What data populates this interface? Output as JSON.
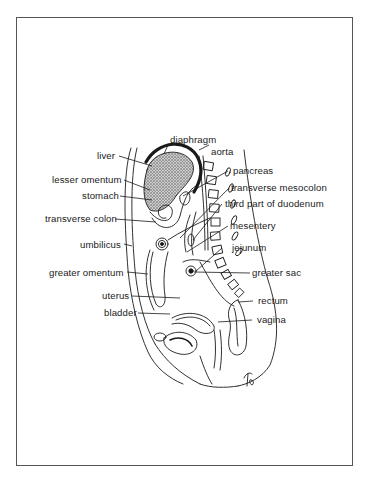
{
  "figure": {
    "type": "anatomical-sagittal-section",
    "signature": "TB",
    "labels_left": [
      {
        "id": "liver",
        "text": "liver"
      },
      {
        "id": "lesser-omentum",
        "text": "lesser omentum"
      },
      {
        "id": "stomach",
        "text": "stomach"
      },
      {
        "id": "transverse-colon",
        "text": "transverse colon"
      },
      {
        "id": "umbilicus",
        "text": "umbilicus"
      },
      {
        "id": "greater-omentum",
        "text": "greater omentum"
      },
      {
        "id": "uterus",
        "text": "uterus"
      },
      {
        "id": "bladder",
        "text": "bladder"
      }
    ],
    "labels_top": [
      {
        "id": "diaphragm",
        "text": "diaphragm"
      }
    ],
    "labels_right": [
      {
        "id": "aorta",
        "text": "aorta"
      },
      {
        "id": "pancreas",
        "text": "pancreas"
      },
      {
        "id": "transverse-mesocolon",
        "text": "transverse mesocolon"
      },
      {
        "id": "third-part-of-duodenum",
        "text": "third part of duodenum"
      },
      {
        "id": "mesentery",
        "text": "mesentery"
      },
      {
        "id": "jejunum",
        "text": "jejunum"
      },
      {
        "id": "greater-sac",
        "text": "greater sac"
      },
      {
        "id": "rectum",
        "text": "rectum"
      },
      {
        "id": "vagina",
        "text": "vagina"
      }
    ],
    "colors": {
      "line": "#1a1a1a",
      "frame": "#555555",
      "background": "#ffffff",
      "liver_stipple": "#555555"
    }
  }
}
